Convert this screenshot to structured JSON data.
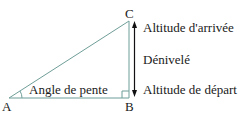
{
  "diagram": {
    "vertices": {
      "A": "A",
      "B": "B",
      "C": "C"
    },
    "angle_label": "Angle de pente",
    "right_labels": {
      "top": "Altitude d'arrivée",
      "middle": "Dénivelé",
      "bottom": "Altitude de départ"
    },
    "colors": {
      "triangle": "#6f9e98",
      "arrow": "#111111",
      "text": "#1a1a1a"
    }
  }
}
